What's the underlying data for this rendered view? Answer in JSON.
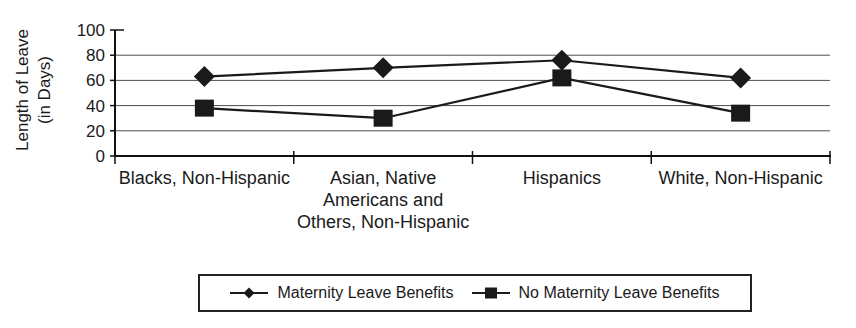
{
  "chart_data": {
    "type": "line",
    "title": "",
    "ylabel": "Length of Leave (in Days)",
    "ylabel_lines": [
      "Length of Leave",
      "(in Days)"
    ],
    "xlabel": "",
    "ylim": [
      0,
      100
    ],
    "yticks": [
      0,
      20,
      40,
      60,
      80,
      100
    ],
    "grid": "horizontal",
    "legend_position": "bottom",
    "categories": [
      "Blacks, Non-Hispanic",
      "Asian, Native Americans and Others, Non-Hispanic",
      "Hispanics",
      "White, Non-Hispanic"
    ],
    "category_label_lines": [
      [
        "Blacks, Non-Hispanic"
      ],
      [
        "Asian, Native",
        "Americans and",
        "Others, Non-Hispanic"
      ],
      [
        "Hispanics"
      ],
      [
        "White, Non-Hispanic"
      ]
    ],
    "series": [
      {
        "name": "Maternity Leave Benefits",
        "marker": "diamond",
        "values": [
          63,
          70,
          76,
          62
        ]
      },
      {
        "name": "No Maternity Leave Benefits",
        "marker": "square",
        "values": [
          38,
          30,
          62,
          34
        ]
      }
    ],
    "colors": {
      "series": "#1a1a1a",
      "grid": "#4d4d4d",
      "axis": "#111111",
      "text": "#1a1a1a",
      "background": "#ffffff"
    }
  }
}
